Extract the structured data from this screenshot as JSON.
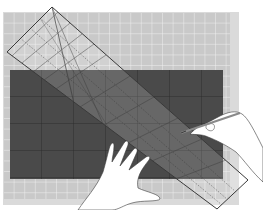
{
  "scene": {
    "title": "Cutting fabric with a ruler on a cutting mat",
    "description": "Illustration of a dark fabric rectangle on a gridded cutting mat, a transparent quilting ruler placed diagonally, a left hand holding the ruler and a right hand marking with a pen"
  },
  "colors": {
    "background": "#ffffff",
    "mat": "#c9c9c9",
    "mat_border": "#dadada",
    "mat_grid": "#efefef",
    "fabric": "#4a4a4a",
    "fabric_grid": "#2a2a2a",
    "ruler_line": "#3a3a3a",
    "ruler_fill": "rgba(255,255,255,0.18)",
    "hand": "#ffffff",
    "hand_outline": "#3a3a3a",
    "pen": "#8a8a8a"
  },
  "objects": [
    {
      "name": "cutting-mat",
      "label": "cutting mat"
    },
    {
      "name": "fabric",
      "label": "dark fabric"
    },
    {
      "name": "ruler",
      "label": "transparent ruler"
    },
    {
      "name": "left-hand",
      "label": "left hand"
    },
    {
      "name": "right-hand",
      "label": "right hand with pen"
    }
  ]
}
